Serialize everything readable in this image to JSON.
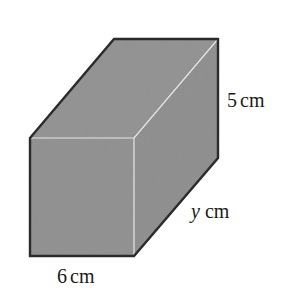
{
  "diagram": {
    "type": "cuboid",
    "colors": {
      "fill": "#8f8f8f",
      "outline": "#2b2b2b",
      "highlight_edge": "#e6e6e6",
      "label": "#1a1a1a"
    },
    "labels": {
      "height": {
        "value": "5",
        "unit": "cm"
      },
      "depth": {
        "value": "y",
        "unit": "cm"
      },
      "width": {
        "value": "6",
        "unit": "cm"
      }
    }
  }
}
